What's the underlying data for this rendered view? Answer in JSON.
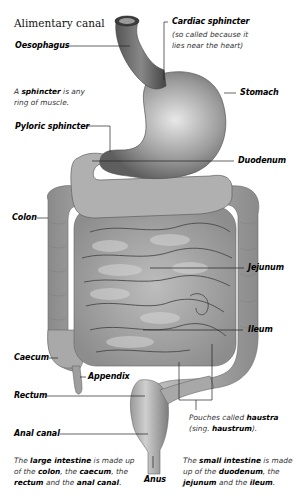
{
  "diagram": {
    "title": "Alimentary canal",
    "labels": {
      "oesophagus": "Oesophagus",
      "cardiac_sphincter": "Cardiac sphincter",
      "cardiac_note_1": "(so called because it",
      "cardiac_note_2": "lies near the heart)",
      "stomach": "Stomach",
      "pyloric_sphincter": "Pyloric sphincter",
      "duodenum": "Duodenum",
      "colon": "Colon",
      "jejunum": "Jejunum",
      "ileum": "Ileum",
      "caecum": "Caecum",
      "appendix": "Appendix",
      "rectum": "Rectum",
      "anal_canal": "Anal canal",
      "anus": "Anus"
    },
    "notes": {
      "sphincter": {
        "pre": "A ",
        "bold": "sphincter",
        "post1": " is any",
        "line2": "ring of muscle."
      },
      "haustra": {
        "pre": "Pouches called ",
        "bold1": "haustra",
        "line2_pre": "(sing. ",
        "bold2": "haustrum",
        "line2_post": ")."
      },
      "large_intestine": {
        "t1": "The ",
        "b1": "large intestine",
        "t2": " is made up",
        "t3": "of the ",
        "b2": "colon",
        "t4": ", the ",
        "b3": "caecum",
        "t5": ", the",
        "b4": "rectum",
        "t6": " and the ",
        "b5": "anal canal",
        "t7": "."
      },
      "small_intestine": {
        "t1": "The ",
        "b1": "small intestine",
        "t2": " is made",
        "t3": "up of the ",
        "b2": "duodenum",
        "t4": ", the",
        "b3": "jejunum",
        "t5": " and the ",
        "b4": "ileum",
        "t6": "."
      }
    },
    "colors": {
      "background": "#ffffff",
      "organ_light": "#c8c8c8",
      "organ_mid": "#9a9a9a",
      "organ_dark": "#5a5a5a",
      "leader_line": "#222222"
    }
  }
}
